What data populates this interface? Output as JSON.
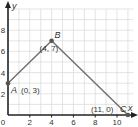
{
  "chart_data": {
    "type": "line",
    "title": "",
    "xlabel": "x",
    "ylabel": "y",
    "xlim": [
      0,
      11.5
    ],
    "ylim": [
      0,
      10
    ],
    "grid": true,
    "x_ticks": [
      2,
      4,
      6,
      8,
      10
    ],
    "y_ticks": [
      2,
      4,
      6,
      8
    ],
    "origin_label": "0",
    "points": [
      {
        "name": "A",
        "x": 0,
        "y": 3,
        "coord_label": "(0, 3)"
      },
      {
        "name": "B",
        "x": 4,
        "y": 7,
        "coord_label": "(4, 7)"
      },
      {
        "name": "C",
        "x": 11,
        "y": 0,
        "coord_label": "(11, 0)"
      }
    ],
    "segments": [
      [
        "A",
        "B"
      ],
      [
        "B",
        "C"
      ]
    ]
  },
  "colors": {
    "grid": "#d8d8d8",
    "axis": "#222222",
    "line": "#6e6e6e",
    "point": "#555555"
  }
}
